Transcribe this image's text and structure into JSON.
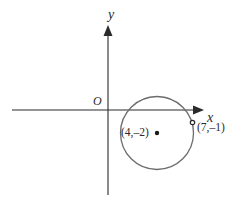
{
  "diagram": {
    "type": "coordinate-plane",
    "axes": {
      "x_label": "x",
      "y_label": "y",
      "origin_label": "O"
    },
    "circle": {
      "center": {
        "label": "(4,–2)",
        "x": 4,
        "y": -2
      },
      "point_on_circle": {
        "label": "(7,–1)",
        "x": 7,
        "y": -1
      }
    },
    "colors": {
      "axis": "#2a2a2a",
      "circle": "#6b6b6b",
      "text": "#2a2a2a"
    }
  }
}
